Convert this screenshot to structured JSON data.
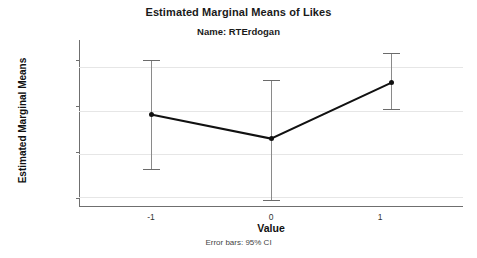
{
  "chart_data": {
    "type": "line",
    "title": "Estimated Marginal Means of Likes",
    "subtitle": "Name: RTErdogan",
    "footnote": "Error bars: 95% CI",
    "xlabel": "Value",
    "ylabel": "Estimated Marginal Means",
    "categories": [
      "-1",
      "0",
      "1"
    ],
    "values": [
      9550,
      6750,
      13200
    ],
    "error_low": [
      3250,
      -300,
      10150
    ],
    "error_high": [
      15850,
      13550,
      16600
    ],
    "series": [
      {
        "name": "RTErdogan",
        "values": [
          9550,
          6750,
          13200
        ]
      }
    ],
    "yticks": [
      "0",
      "5000",
      "10000",
      "15000"
    ],
    "ytick_values": [
      0,
      5000,
      10000,
      15000
    ],
    "xticks": [
      "-1",
      "0",
      "1"
    ],
    "ylim": [
      -1150,
      18150
    ],
    "xlim": [
      -1.5,
      1.5
    ],
    "grid": true,
    "legend": "none",
    "error_bar_type": "95% CI",
    "colors": {
      "line": "#111111",
      "marker": "#111111",
      "errorbar": "#8a8a8a",
      "gridline": "#e6e6e6",
      "axis": "#6f6f6f",
      "background": "#ffffff",
      "text": "#1a1a1a"
    }
  }
}
